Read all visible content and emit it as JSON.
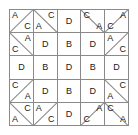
{
  "puzzle": {
    "title": "letter-grid-puzzle",
    "rows": 5,
    "cols": 5,
    "colors": {
      "background": "#ffffff",
      "grid_line": "#8a8a8a",
      "letter": "#1a1a1a"
    },
    "letters_used": [
      "A",
      "B",
      "C",
      "D"
    ],
    "cells": [
      [
        {
          "split": "anti",
          "letters": [
            {
              "text": "A",
              "pos": "pos-tl"
            },
            {
              "text": "C",
              "pos": "pos-br"
            }
          ]
        },
        {
          "split": "main",
          "letters": [
            {
              "text": "C",
              "pos": "pos-tr"
            },
            {
              "text": "A",
              "pos": "pos-bl"
            }
          ]
        },
        {
          "split": "none",
          "letters": [
            {
              "text": "D",
              "pos": "pos-center"
            }
          ]
        },
        {
          "split": "main",
          "letters": [
            {
              "text": "C",
              "pos": "pos-tl"
            },
            {
              "text": "A",
              "pos": "pos-br"
            }
          ]
        },
        {
          "split": "anti",
          "letters": [
            {
              "text": "A",
              "pos": "pos-tr"
            },
            {
              "text": "C",
              "pos": "pos-bl"
            }
          ]
        }
      ],
      [
        {
          "split": "main",
          "letters": [
            {
              "text": "A",
              "pos": "pos-tr"
            },
            {
              "text": "C",
              "pos": "pos-bl"
            }
          ]
        },
        {
          "split": "none",
          "letters": [
            {
              "text": "D",
              "pos": "pos-center"
            }
          ]
        },
        {
          "split": "none",
          "letters": [
            {
              "text": "B",
              "pos": "pos-center"
            }
          ]
        },
        {
          "split": "none",
          "letters": [
            {
              "text": "D",
              "pos": "pos-center"
            }
          ]
        },
        {
          "split": "anti",
          "letters": [
            {
              "text": "A",
              "pos": "pos-tl"
            },
            {
              "text": "C",
              "pos": "pos-br"
            }
          ]
        }
      ],
      [
        {
          "split": "none",
          "letters": [
            {
              "text": "D",
              "pos": "pos-center"
            }
          ]
        },
        {
          "split": "none",
          "letters": [
            {
              "text": "B",
              "pos": "pos-center"
            }
          ]
        },
        {
          "split": "none",
          "letters": [
            {
              "text": "D",
              "pos": "pos-center"
            }
          ]
        },
        {
          "split": "none",
          "letters": [
            {
              "text": "B",
              "pos": "pos-center"
            }
          ]
        },
        {
          "split": "none",
          "letters": [
            {
              "text": "D",
              "pos": "pos-center"
            }
          ]
        }
      ],
      [
        {
          "split": "anti",
          "letters": [
            {
              "text": "C",
              "pos": "pos-tl"
            },
            {
              "text": "A",
              "pos": "pos-br"
            }
          ]
        },
        {
          "split": "none",
          "letters": [
            {
              "text": "D",
              "pos": "pos-center"
            }
          ]
        },
        {
          "split": "none",
          "letters": [
            {
              "text": "B",
              "pos": "pos-center"
            }
          ]
        },
        {
          "split": "none",
          "letters": [
            {
              "text": "D",
              "pos": "pos-center"
            }
          ]
        },
        {
          "split": "main",
          "letters": [
            {
              "text": "C",
              "pos": "pos-tr"
            },
            {
              "text": "A",
              "pos": "pos-bl"
            }
          ]
        }
      ],
      [
        {
          "split": "main",
          "letters": [
            {
              "text": "C",
              "pos": "pos-tr"
            },
            {
              "text": "A",
              "pos": "pos-bl"
            }
          ]
        },
        {
          "split": "anti",
          "letters": [
            {
              "text": "A",
              "pos": "pos-tl"
            },
            {
              "text": "C",
              "pos": "pos-br"
            }
          ]
        },
        {
          "split": "none",
          "letters": [
            {
              "text": "D",
              "pos": "pos-center"
            }
          ]
        },
        {
          "split": "anti",
          "letters": [
            {
              "text": "A",
              "pos": "pos-tr"
            },
            {
              "text": "C",
              "pos": "pos-bl"
            }
          ]
        },
        {
          "split": "main",
          "letters": [
            {
              "text": "C",
              "pos": "pos-tl"
            },
            {
              "text": "A",
              "pos": "pos-br"
            }
          ]
        }
      ]
    ]
  }
}
